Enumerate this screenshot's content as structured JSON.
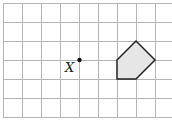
{
  "diagram": {
    "type": "grid-figure",
    "grid": {
      "cols": 9,
      "rows": 6,
      "cell_px": 19,
      "origin_px": [
        3,
        3
      ],
      "line_color": "#b5b5b5"
    },
    "point": {
      "label": "X",
      "grid_pos": [
        4,
        3
      ]
    },
    "shape": {
      "name": "pentagon",
      "vertices_grid": [
        [
          6,
          3
        ],
        [
          7,
          2
        ],
        [
          8,
          3
        ],
        [
          7,
          4
        ],
        [
          6,
          4
        ]
      ],
      "fill": "#e6e6e6",
      "stroke": "#222222"
    }
  }
}
